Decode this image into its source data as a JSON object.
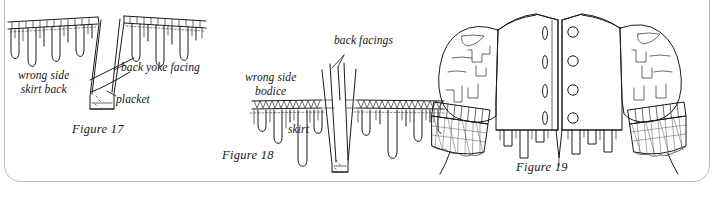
{
  "plate": {
    "title": "Sewing construction diagrams: back yoke placket, bodice-skirt joining, finished bodice back",
    "frame_color": "#b9b9bd",
    "ink_color": "#1b1b1b",
    "background_color": "#ffffff"
  },
  "figures": [
    {
      "id": "figure-17",
      "caption": "Figure 17",
      "subject": "gathered skirt back with placket and back yoke facing",
      "labels": [
        {
          "name": "wrong-side-skirt-back",
          "line1": "wrong side",
          "line2": "skirt back"
        },
        {
          "name": "back-yoke-facing",
          "text": "back yoke facing"
        },
        {
          "name": "placket",
          "text": "placket"
        }
      ]
    },
    {
      "id": "figure-18",
      "caption": "Figure 18",
      "subject": "bodice joined to skirt showing back facings at the opening",
      "labels": [
        {
          "name": "wrong-side-bodice",
          "line1": "wrong side",
          "line2": "bodice"
        },
        {
          "name": "back-facings",
          "text": "back facings"
        },
        {
          "name": "skirt",
          "text": "skirt"
        }
      ]
    },
    {
      "id": "figure-19",
      "caption": "Figure 19",
      "subject": "finished bodice back with buttons, buttonholes, puffed sleeves and pleated cuffs",
      "labels": [],
      "details": {
        "buttonhole_count": 4,
        "button_count": 4
      }
    }
  ]
}
